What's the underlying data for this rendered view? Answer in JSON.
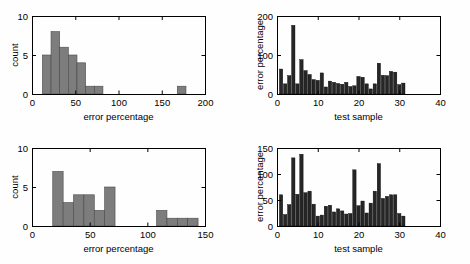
{
  "figure": {
    "background": "#fefefe",
    "panel_count": 4
  },
  "chart_data": [
    {
      "id": "top-left",
      "type": "bar",
      "title": "",
      "xlabel": "error percentage",
      "ylabel": "count",
      "xlim": [
        0,
        200
      ],
      "ylim": [
        0,
        10
      ],
      "xticks": [
        0,
        50,
        100,
        150,
        200
      ],
      "xticklabels": [
        "0",
        "50",
        "100",
        "150",
        "200"
      ],
      "yticks": [
        0,
        5,
        10
      ],
      "yticklabels": [
        "0",
        "5",
        "10"
      ],
      "grid": false,
      "bar_color": "#7d7d7d",
      "bar_edge_color": "#4a4a4a",
      "bin_width": 10,
      "bin_starts": [
        12,
        22,
        32,
        42,
        52,
        62,
        72,
        168
      ],
      "values": [
        5,
        8,
        6,
        5,
        4,
        1,
        1,
        1
      ]
    },
    {
      "id": "top-right",
      "type": "bar",
      "title": "",
      "xlabel": "test sample",
      "ylabel": "error percentage",
      "xlim": [
        0,
        40
      ],
      "ylim": [
        0,
        200
      ],
      "xticks": [
        0,
        10,
        20,
        30,
        40
      ],
      "xticklabels": [
        "0",
        "10",
        "20",
        "30",
        "40"
      ],
      "yticks": [
        0,
        100,
        200
      ],
      "yticklabels": [
        "0",
        "100",
        "200"
      ],
      "grid": false,
      "bar_color": "#262626",
      "bar_edge_color": "#000000",
      "x": [
        1,
        2,
        3,
        4,
        5,
        6,
        7,
        8,
        9,
        10,
        11,
        12,
        13,
        14,
        15,
        16,
        17,
        18,
        19,
        20,
        21,
        22,
        23,
        24,
        25,
        26,
        27,
        28,
        29,
        30,
        31
      ],
      "values": [
        64,
        26,
        47,
        176,
        26,
        88,
        60,
        50,
        37,
        35,
        54,
        18,
        33,
        30,
        27,
        25,
        30,
        19,
        21,
        45,
        43,
        26,
        13,
        26,
        79,
        48,
        47,
        58,
        56,
        24,
        28
      ]
    },
    {
      "id": "bottom-left",
      "type": "bar",
      "title": "",
      "xlabel": "error percentage",
      "ylabel": "count",
      "xlim": [
        0,
        150
      ],
      "ylim": [
        0,
        10
      ],
      "xticks": [
        0,
        50,
        100,
        150
      ],
      "xticklabels": [
        "0",
        "50",
        "100",
        "150"
      ],
      "yticks": [
        0,
        5,
        10
      ],
      "yticklabels": [
        "0",
        "5",
        "10"
      ],
      "grid": false,
      "bar_color": "#7d7d7d",
      "bar_edge_color": "#4a4a4a",
      "bin_width": 9,
      "bin_starts": [
        18,
        27,
        36,
        45,
        54,
        63,
        108,
        117,
        126,
        135
      ],
      "values": [
        7,
        3,
        4,
        4,
        2,
        5,
        2,
        1,
        1,
        1
      ]
    },
    {
      "id": "bottom-right",
      "type": "bar",
      "title": "",
      "xlabel": "test sample",
      "ylabel": "error percentage",
      "xlim": [
        0,
        40
      ],
      "ylim": [
        0,
        150
      ],
      "xticks": [
        0,
        10,
        20,
        30,
        40
      ],
      "xticklabels": [
        "0",
        "10",
        "20",
        "30",
        "40"
      ],
      "yticks": [
        0,
        50,
        100,
        150
      ],
      "yticklabels": [
        "0",
        "50",
        "100",
        "150"
      ],
      "grid": false,
      "bar_color": "#262626",
      "bar_edge_color": "#000000",
      "x": [
        1,
        2,
        3,
        4,
        5,
        6,
        7,
        8,
        9,
        10,
        11,
        12,
        13,
        14,
        15,
        16,
        17,
        18,
        19,
        20,
        21,
        22,
        23,
        24,
        25,
        26,
        27,
        28,
        29,
        30,
        31
      ],
      "values": [
        60,
        22,
        41,
        131,
        61,
        138,
        64,
        67,
        42,
        19,
        21,
        38,
        40,
        27,
        33,
        29,
        23,
        24,
        108,
        39,
        48,
        25,
        44,
        67,
        120,
        53,
        57,
        60,
        60,
        24,
        19
      ]
    }
  ]
}
